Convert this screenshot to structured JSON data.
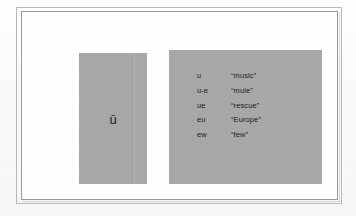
{
  "page": {
    "kind": "scanned-worksheet-figure",
    "background_color": "#fdfdfd",
    "frame_color": "#9a9a9a",
    "panel_color": "#a8a8a8",
    "text_color": "#1c1c1c"
  },
  "letter_panel": {
    "letter": "ū",
    "label": "long-u-with-macron"
  },
  "spelling_panel": {
    "rows": [
      {
        "pattern": "u",
        "example": "“music”"
      },
      {
        "pattern": "u-e",
        "example": "“mule”"
      },
      {
        "pattern": "ue",
        "example": "“rescue”"
      },
      {
        "pattern": "eu",
        "example": "“Europe”"
      },
      {
        "pattern": "ew",
        "example": "“few”"
      }
    ]
  }
}
